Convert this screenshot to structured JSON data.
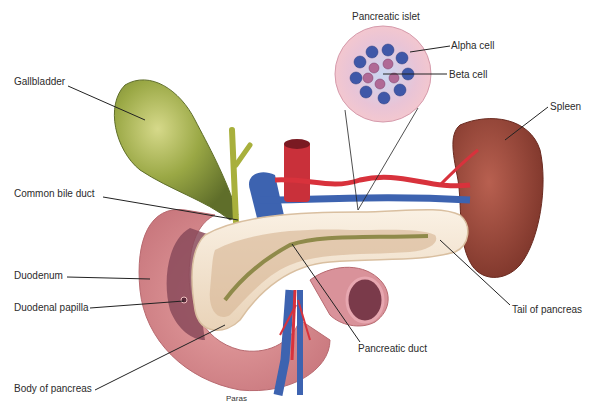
{
  "labels": {
    "gallbladder": "Gallbladder",
    "common_bile_duct": "Common bile duct",
    "duodenum": "Duodenum",
    "duodenal_papilla": "Duodenal papilla",
    "body_of_pancreas": "Body of pancreas",
    "pancreatic_islet": "Pancreatic islet",
    "alpha_cell": "Alpha cell",
    "beta_cell": "Beta cell",
    "spleen": "Spleen",
    "tail_of_pancreas": "Tail of pancreas",
    "pancreatic_duct": "Pancreatic duct"
  },
  "credit": "Paras",
  "colors": {
    "gallbladder": "#9aa845",
    "bile_duct": "#a8b03c",
    "duodenum": "#d98c8c",
    "duodenum_inner": "#8a4a5a",
    "pancreas": "#f1e3cf",
    "pancreas_edge": "#e2c7a8",
    "duct": "#8f8a4a",
    "artery": "#d8323c",
    "vein": "#3d63b0",
    "spleen": "#9c4a3c",
    "islet_bg": "#f2c9d2",
    "alpha": "#3f58a8",
    "beta": "#b06a96",
    "leader": "#222222"
  }
}
